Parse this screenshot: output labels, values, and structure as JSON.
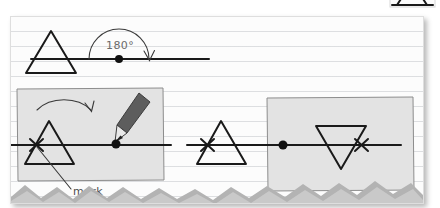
{
  "page": {
    "background_color": "#ffffff",
    "card": {
      "background_color": "#fcfcfc",
      "border_color": "#dedede",
      "ruled_line_color": "#bec1c6"
    }
  },
  "diagram": {
    "title_visible": false,
    "annotations": {
      "angle_label": "180°",
      "mark_label": "mark"
    },
    "colors": {
      "ink": "#1a1a1a",
      "shade_fill": "#e3e3e3",
      "shade_stroke": "#8d8d8d",
      "pencil": "#5d5d5d",
      "handwriting": "#6a6a6a",
      "zigzag": "#c9c9c9"
    },
    "steps": [
      {
        "id": "step-rotation",
        "name": "rotation-overview",
        "shapes": [
          "triangle-upright",
          "horizontal-axis",
          "rotation-dot",
          "semicircle-arrow"
        ],
        "label": "180°"
      },
      {
        "id": "step-mark",
        "name": "marking-step",
        "shapes": [
          "shaded-box",
          "curved-arrow",
          "triangle-upright",
          "x-mark",
          "pencil",
          "axis-dot",
          "leader-line"
        ],
        "label": "mark"
      },
      {
        "id": "step-middle",
        "name": "triangle-before-rotation",
        "shapes": [
          "triangle-upright",
          "x-mark",
          "horizontal-axis"
        ],
        "label": ""
      },
      {
        "id": "step-result",
        "name": "rotated-result",
        "shapes": [
          "shaded-box",
          "triangle-inverted",
          "x-mark",
          "axis-dot",
          "horizontal-axis"
        ],
        "label": ""
      }
    ],
    "bottom_border": {
      "name": "zigzag-band",
      "style": "torn-mountain-edge"
    }
  }
}
